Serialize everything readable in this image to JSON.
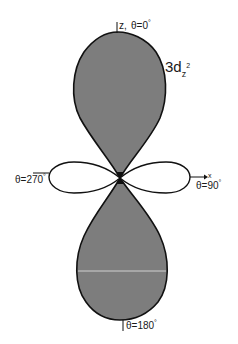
{
  "diagram": {
    "title": "3d",
    "title_subscript": "z",
    "title_superscript": "2",
    "orbital_name": "3dz2",
    "labels": {
      "z_axis": "z,",
      "top": "θ=0°",
      "top_text": "θ=0",
      "left": "θ=270°",
      "left_text": "θ=270",
      "right": "θ=90°",
      "right_text": "θ=90",
      "bottom": "θ=180°",
      "bottom_text": "θ=180",
      "x_axis": "x",
      "degree": "°"
    },
    "lobes": [
      {
        "name": "upper-lobe",
        "shaded": true,
        "direction": "+z"
      },
      {
        "name": "lower-lobe",
        "shaded": true,
        "direction": "-z"
      },
      {
        "name": "left-lobe",
        "shaded": false,
        "direction": "-x"
      },
      {
        "name": "right-lobe",
        "shaded": false,
        "direction": "+x"
      }
    ],
    "colors": {
      "shaded_fill": "#7d7d7d",
      "outline": "#111111",
      "background": "#ffffff"
    }
  }
}
